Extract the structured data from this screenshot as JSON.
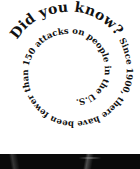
{
  "spiral": {
    "heading": "Did you know?",
    "body": "Since 1900, there have been fewer than 150 attacks on people in the U.S."
  },
  "colors": {
    "text": "#111111",
    "background": "#ffffff",
    "photo": "#0a0a0a"
  }
}
